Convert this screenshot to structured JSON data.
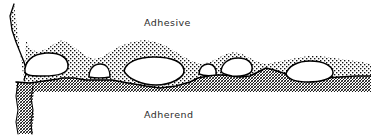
{
  "figure": {
    "kind": "technical-line-diagram",
    "background_color": "#ffffff",
    "line_color": "#000000",
    "width_px": 371,
    "height_px": 136
  },
  "labels": {
    "adhesive": "Adhesive",
    "adherend": "Adherend"
  },
  "label_positions": {
    "adhesive": {
      "x": 144,
      "y": 26
    },
    "adherend": {
      "x": 144,
      "y": 118
    }
  },
  "regions": {
    "adhesive": {
      "name": "Adhesive",
      "fill_pattern": "fine-dot-stipple",
      "pattern_color": "#1a1a1a",
      "position": "upper"
    },
    "adherend": {
      "name": "Adherend",
      "fill_pattern": "dense-crosshatch",
      "pattern_color": "#1a1a1a",
      "position": "lower"
    },
    "voids": {
      "name": "Interfacial voids",
      "fill": "#ffffff",
      "outline_color": "#000000",
      "count": 6
    }
  },
  "geometry": {
    "adherend_top_profile": "M 0 86 L 30 83 L 58 79 L 62 78 L 74 78 L 86 80 L 100 80 L 112 80 L 128 83 L 146 86 L 160 88 L 176 86 L 190 82 L 198 78 L 208 76 L 214 75 L 222 75 L 232 76 L 240 77 L 250 76 L 258 72 L 266 68 L 274 70 L 286 74 L 296 76 L 310 78 L 326 78 L 340 77 L 356 76 L 371 76",
    "adhesive_top_profile": "M 14 4 L 18 16 L 22 28 L 26 40 L 30 49 L 38 52 L 46 49 L 54 44 L 62 40 L 70 44 L 78 50 L 86 56 L 94 59 L 102 57 L 110 52 L 120 46 L 132 42 L 144 40 L 156 42 L 166 46 L 176 52 L 186 58 L 194 62 L 202 64 L 210 62 L 218 58 L 226 54 L 234 52 L 242 54 L 250 58 L 258 62 L 266 64 L 276 62 L 286 60 L 296 58 L 308 56 L 320 56 L 334 58 L 348 60 L 362 62 L 371 64",
    "adherend_left_stem": "M 18 82 L 16 96 L 18 110 L 16 122 L 18 132 L 30 132 L 32 120 L 30 106 L 32 94 L 30 84",
    "adhesive_left_tail": "M 14 4 L 10 16 L 12 30 L 16 42 L 20 52 L 24 60 L 28 70 L 24 78"
  },
  "voids": [
    {
      "id": "void-1",
      "cx": 46,
      "cy": 64,
      "rx": 22,
      "ry": 10,
      "size": "large"
    },
    {
      "id": "void-2",
      "cx": 99,
      "cy": 72,
      "rx": 10,
      "ry": 6,
      "size": "small"
    },
    {
      "id": "void-3",
      "cx": 153,
      "cy": 72,
      "rx": 30,
      "ry": 12,
      "size": "largest"
    },
    {
      "id": "void-4",
      "cx": 207,
      "cy": 69,
      "rx": 9,
      "ry": 5,
      "size": "small"
    },
    {
      "id": "void-5",
      "cx": 236,
      "cy": 65,
      "rx": 16,
      "ry": 7,
      "size": "medium"
    },
    {
      "id": "void-6",
      "cx": 309,
      "cy": 70,
      "rx": 24,
      "ry": 9,
      "size": "large"
    }
  ]
}
